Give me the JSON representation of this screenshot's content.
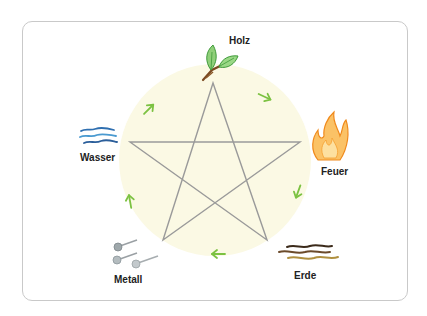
{
  "colors": {
    "background_circle": "#fbf9e4",
    "star_line": "#9a9a9a",
    "arrow": "#7cc242",
    "frame": "#c9c9c9"
  },
  "elements": [
    {
      "id": "holz",
      "label": "Holz",
      "icon": "leaves-icon"
    },
    {
      "id": "feuer",
      "label": "Feuer",
      "icon": "flame-icon"
    },
    {
      "id": "erde",
      "label": "Erde",
      "icon": "earth-strands-icon"
    },
    {
      "id": "metall",
      "label": "Metall",
      "icon": "metal-pins-icon"
    },
    {
      "id": "wasser",
      "label": "Wasser",
      "icon": "water-waves-icon"
    }
  ],
  "cycle_order": [
    "Holz",
    "Feuer",
    "Erde",
    "Metall",
    "Wasser"
  ]
}
